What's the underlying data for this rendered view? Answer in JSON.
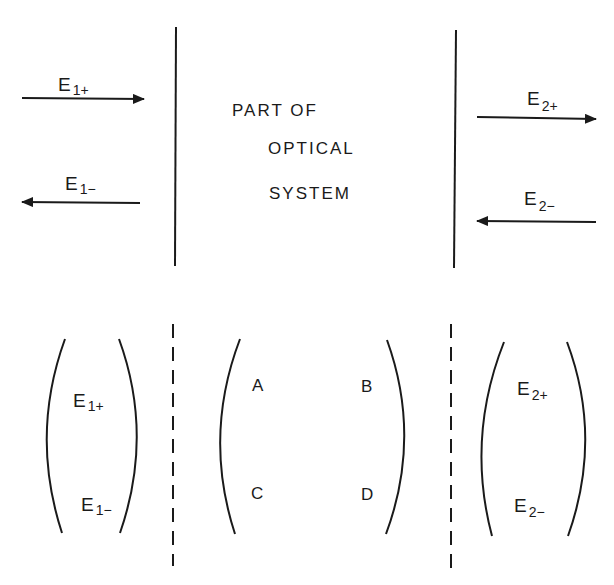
{
  "diagram": {
    "top": {
      "system_text": [
        "PART OF",
        "OPTICAL",
        "SYSTEM"
      ],
      "left_waves": {
        "forward": {
          "base": "E",
          "sub": "1+"
        },
        "backward": {
          "base": "E",
          "sub": "1−"
        }
      },
      "right_waves": {
        "forward": {
          "base": "E",
          "sub": "2+"
        },
        "backward": {
          "base": "E",
          "sub": "2−"
        }
      }
    },
    "bottom": {
      "input_vector": [
        {
          "base": "E",
          "sub": "1+"
        },
        {
          "base": "E",
          "sub": "1−"
        }
      ],
      "matrix": {
        "a": "A",
        "b": "B",
        "c": "C",
        "d": "D"
      },
      "output_vector": [
        {
          "base": "E",
          "sub": "2+"
        },
        {
          "base": "E",
          "sub": "2−"
        }
      ]
    },
    "colors": {
      "ink": "#1a1a1a",
      "background": "#ffffff"
    }
  }
}
